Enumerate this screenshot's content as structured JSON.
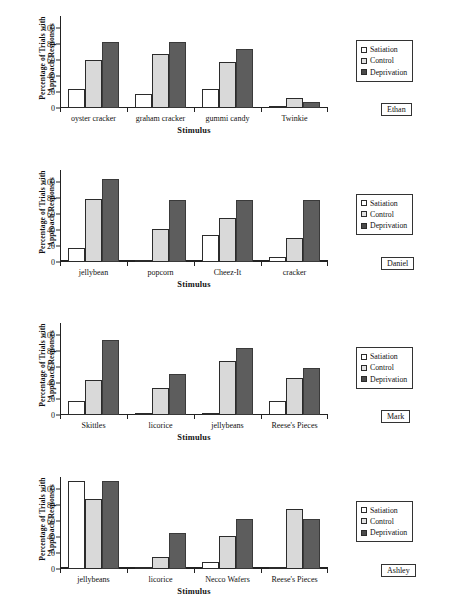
{
  "figure": {
    "axis": {
      "ylabel": "Percentage of Trials with Approach Responses",
      "xlabel": "Stimulus",
      "yticks": [
        "0",
        "20",
        "40",
        "60",
        "80",
        "100"
      ],
      "ylim": [
        0,
        115
      ]
    },
    "legend": {
      "items": [
        {
          "label": "Satiation",
          "color": "#ffffff"
        },
        {
          "label": "Control",
          "color": "#d9d9d9"
        },
        {
          "label": "Deprivation",
          "color": "#5d5d5d"
        }
      ]
    }
  },
  "chart_data": [
    {
      "type": "bar",
      "title": "Ethan",
      "participant": "Ethan",
      "categories": [
        "oyster cracker",
        "graham cracker",
        "gummi candy",
        "Twinkie"
      ],
      "series": [
        {
          "name": "Satiation",
          "values": [
            24,
            17,
            24,
            1
          ]
        },
        {
          "name": "Control",
          "values": [
            60,
            67,
            58,
            13
          ]
        },
        {
          "name": "Deprivation",
          "values": [
            83,
            82,
            74,
            7
          ]
        }
      ],
      "xlabel": "Stimulus",
      "ylabel": "Percentage of Trials with Approach Responses",
      "ylim": [
        0,
        115
      ],
      "grid": false,
      "legend_position": "right"
    },
    {
      "type": "bar",
      "title": "Daniel",
      "participant": "Daniel",
      "categories": [
        "jellybean",
        "popcorn",
        "Cheez-It",
        "cracker"
      ],
      "series": [
        {
          "name": "Satiation",
          "values": [
            17,
            1,
            33,
            6
          ]
        },
        {
          "name": "Control",
          "values": [
            78,
            41,
            55,
            30
          ]
        },
        {
          "name": "Deprivation",
          "values": [
            103,
            77,
            77,
            77
          ]
        }
      ],
      "xlabel": "Stimulus",
      "ylabel": "Percentage of Trials with Approach Responses",
      "ylim": [
        0,
        115
      ],
      "grid": false,
      "legend_position": "right"
    },
    {
      "type": "bar",
      "title": "Mark",
      "participant": "Mark",
      "categories": [
        "Skittles",
        "licorice",
        "jellybeans",
        "Reese's Pieces"
      ],
      "series": [
        {
          "name": "Satiation",
          "values": [
            17,
            1,
            1,
            18
          ]
        },
        {
          "name": "Control",
          "values": [
            44,
            34,
            68,
            46
          ]
        },
        {
          "name": "Deprivation",
          "values": [
            94,
            51,
            84,
            59
          ]
        }
      ],
      "xlabel": "Stimulus",
      "ylabel": "Percentage of Trials with Approach Responses",
      "ylim": [
        0,
        115
      ],
      "grid": false,
      "legend_position": "right"
    },
    {
      "type": "bar",
      "title": "Ashley",
      "participant": "Ashley",
      "categories": [
        "jellybeans",
        "licorice",
        "Necco Wafers",
        "Reese's Pieces"
      ],
      "series": [
        {
          "name": "Satiation",
          "values": [
            110,
            1,
            8,
            1
          ]
        },
        {
          "name": "Control",
          "values": [
            87,
            14,
            41,
            75
          ]
        },
        {
          "name": "Deprivation",
          "values": [
            110,
            45,
            62,
            62
          ]
        }
      ],
      "xlabel": "Stimulus",
      "ylabel": "Percentage of Trials with Approach Responses",
      "ylim": [
        0,
        115
      ],
      "grid": false,
      "legend_position": "right"
    }
  ]
}
